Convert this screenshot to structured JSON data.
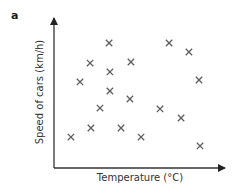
{
  "panel_label": "a",
  "chart_data": {
    "type": "scatter",
    "title": "",
    "xlabel": "Temperature (°C)",
    "ylabel": "Speed of cars (km/h)",
    "xlim": [
      0,
      100
    ],
    "ylim": [
      0,
      100
    ],
    "grid": false,
    "legend": null,
    "axis_ticks": "none (qualitative axes; values are normalized 0–100 positions estimated from pixels)",
    "marker": "x",
    "marker_color": "#5f5f5f",
    "series": [
      {
        "name": "cars",
        "points": [
          {
            "x": 9.9,
            "y": 20.5
          },
          {
            "x": 15.2,
            "y": 57.0
          },
          {
            "x": 21.1,
            "y": 69.5
          },
          {
            "x": 21.6,
            "y": 26.5
          },
          {
            "x": 26.9,
            "y": 39.7
          },
          {
            "x": 32.2,
            "y": 82.8
          },
          {
            "x": 32.7,
            "y": 63.6
          },
          {
            "x": 32.7,
            "y": 51.0
          },
          {
            "x": 39.2,
            "y": 26.5
          },
          {
            "x": 44.4,
            "y": 45.7
          },
          {
            "x": 45.0,
            "y": 70.2
          },
          {
            "x": 50.9,
            "y": 20.5
          },
          {
            "x": 62.0,
            "y": 39.1
          },
          {
            "x": 67.3,
            "y": 82.8
          },
          {
            "x": 74.3,
            "y": 33.1
          },
          {
            "x": 78.9,
            "y": 76.8
          },
          {
            "x": 84.8,
            "y": 58.3
          },
          {
            "x": 85.4,
            "y": 14.6
          }
        ]
      }
    ],
    "axis_color": "#333333"
  }
}
